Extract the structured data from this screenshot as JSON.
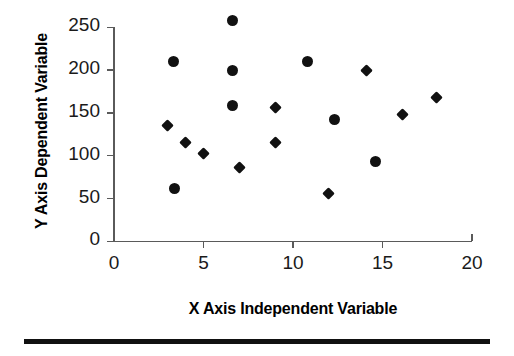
{
  "chart_data": {
    "type": "scatter",
    "title": "",
    "xlabel": "X Axis Independent Variable",
    "ylabel": "Y Axis Dependent Variable",
    "xlim": [
      0,
      20
    ],
    "ylim": [
      0,
      250
    ],
    "xticks": [
      0,
      5,
      10,
      15,
      20
    ],
    "yticks": [
      0,
      50,
      100,
      150,
      200,
      250
    ],
    "xtick_labels": [
      "0",
      "5",
      "10",
      "15",
      "20"
    ],
    "ytick_labels": [
      "0",
      "50",
      "100",
      "150",
      "200",
      "250"
    ],
    "grid": false,
    "legend": "none",
    "series": [
      {
        "name": "circles",
        "marker": "circle",
        "color": "#111111",
        "points": [
          {
            "x": 3.4,
            "y": 62
          },
          {
            "x": 3.3,
            "y": 210
          },
          {
            "x": 6.6,
            "y": 258
          },
          {
            "x": 6.6,
            "y": 200
          },
          {
            "x": 6.6,
            "y": 159
          },
          {
            "x": 10.8,
            "y": 210
          },
          {
            "x": 12.3,
            "y": 142
          },
          {
            "x": 14.6,
            "y": 93
          }
        ]
      },
      {
        "name": "diamonds",
        "marker": "diamond",
        "color": "#111111",
        "points": [
          {
            "x": 3.0,
            "y": 135
          },
          {
            "x": 4.0,
            "y": 116
          },
          {
            "x": 5.0,
            "y": 103
          },
          {
            "x": 7.0,
            "y": 86
          },
          {
            "x": 9.0,
            "y": 156
          },
          {
            "x": 9.0,
            "y": 116
          },
          {
            "x": 12.0,
            "y": 56
          },
          {
            "x": 14.1,
            "y": 200
          },
          {
            "x": 16.1,
            "y": 148
          },
          {
            "x": 18.0,
            "y": 168
          }
        ]
      }
    ]
  }
}
